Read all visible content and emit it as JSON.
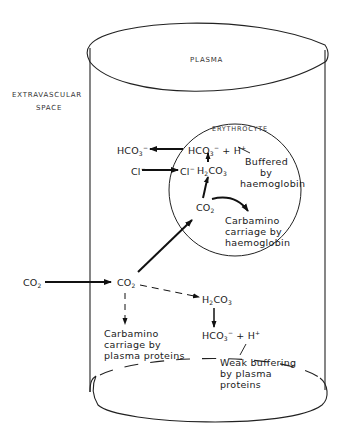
{
  "diagram": {
    "labels": {
      "plasma": "PLASMA",
      "extravascular_1": "EXTRAVASCULAR",
      "extravascular_2": "SPACE",
      "erythrocyte": "ERYTHROCYTE"
    },
    "species": {
      "hco3_out": "HCO",
      "hco3_in": "HCO",
      "h_plus": "H",
      "cl_out": "Cl",
      "cl_in": "Cl",
      "h2co3_rbc": "H",
      "co2_rbc": "CO",
      "co2_ext": "CO",
      "co2_plasma": "CO",
      "h2co3_plasma": "H",
      "hco3_plasma": "HCO",
      "h_plasma": "H"
    },
    "notes": {
      "buffered_1": "Buffered",
      "buffered_2": "by",
      "buffered_3": "haemoglobin",
      "carb_hb_1": "Carbamino",
      "carb_hb_2": "carriage by",
      "carb_hb_3": "haemoglobin",
      "carb_pp_1": "Carbamino",
      "carb_pp_2": "carriage by",
      "carb_pp_3": "plasma proteins",
      "weak_1": "Weak buffering",
      "weak_2": "by plasma",
      "weak_3": "proteins"
    }
  }
}
